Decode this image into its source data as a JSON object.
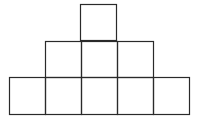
{
  "diagram": {
    "stroke_color": "#2a2a2a",
    "background": "#ffffff",
    "cell_size": 36,
    "rows": [
      {
        "name": "top",
        "count": 1,
        "y": 4,
        "x_start": 80
      },
      {
        "name": "middle",
        "count": 3,
        "y": 41,
        "x_start": 45
      },
      {
        "name": "bottom",
        "count": 5,
        "y": 77,
        "x_start": 9
      }
    ],
    "total_squares": 9
  }
}
